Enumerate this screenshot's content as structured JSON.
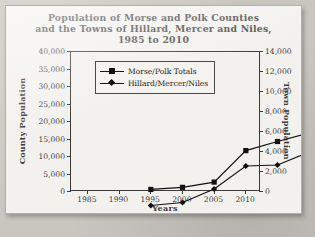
{
  "chart_data": {
    "type": "line",
    "title": "Population of Morse and Polk Counties and the Towns of Hillard, Mercer and Niles, 1985 to 2010",
    "title_lines": [
      "Population of Morse and Polk Counties",
      "and the Towns of Hillard, Mercer and Niles,",
      "1985 to 2010"
    ],
    "xlabel": "Years",
    "ylabel": "County Population",
    "ylabel_right": "Town Population",
    "categories": [
      "1985",
      "1990",
      "1995",
      "2000",
      "2005",
      "2010"
    ],
    "x": [
      1985,
      1990,
      1995,
      2000,
      2005,
      2010
    ],
    "ylim": [
      0,
      40000
    ],
    "ylim_right": [
      0,
      14000
    ],
    "yticks": [
      "0",
      "5,000",
      "10,000",
      "15,000",
      "20,000",
      "25,000",
      "30,000",
      "35,000",
      "40,000"
    ],
    "ytick_values": [
      0,
      5000,
      10000,
      15000,
      20000,
      25000,
      30000,
      35000,
      40000
    ],
    "yticks_right": [
      "0",
      "2,000",
      "4,000",
      "6,000",
      "8,000",
      "10,000",
      "12,000",
      "14,000"
    ],
    "ytick_values_right": [
      0,
      2000,
      4000,
      6000,
      8000,
      10000,
      12000,
      14000
    ],
    "grid": false,
    "legend_position": "upper left",
    "series": [
      {
        "name": "Morse/Polk Totals",
        "axis": "left",
        "marker": "square",
        "color": "#111111",
        "values": [
          13300,
          13900,
          15400,
          24400,
          27000,
          29500
        ]
      },
      {
        "name": "Hillard/Mercer/Niles",
        "axis": "right",
        "marker": "diamond",
        "color": "#111111",
        "values": [
          3050,
          3350,
          4700,
          7000,
          7100,
          8400
        ]
      }
    ]
  },
  "colors": {
    "page_background": "#c9c6c0",
    "card_background": "#f2f1ee",
    "axis": "#3b3b3b",
    "title_text": "#4d4c4a",
    "series_ink": "#111111"
  }
}
